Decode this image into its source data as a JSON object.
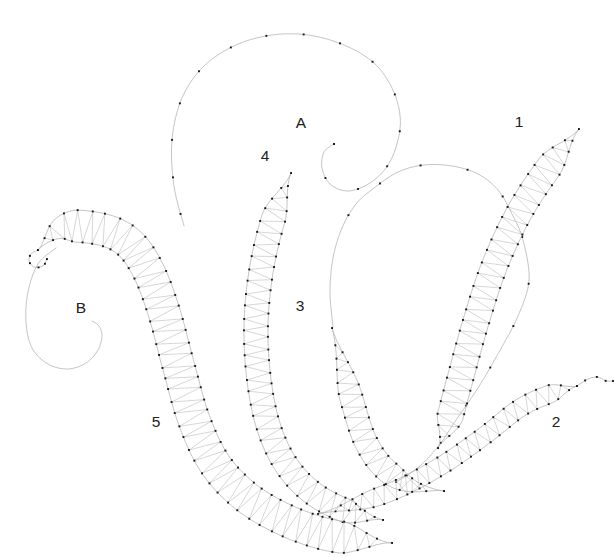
{
  "figure": {
    "type": "lace-pricking-pattern-drawing",
    "width": 615,
    "height": 557,
    "background": "#ffffff"
  },
  "style": {
    "line_color": "#b4b4b4",
    "zigzag_color": "#c6c6c6",
    "dot_color": "#161616",
    "label_color": "#212121",
    "line_width": 0.8,
    "zigzag_width": 0.7,
    "dot_size": 1.9,
    "pin_spacing": 12,
    "curve_dot_spacing": 40
  },
  "labels": [
    {
      "text": "A",
      "x": 301,
      "y": 128
    },
    {
      "text": "1",
      "x": 519,
      "y": 127
    },
    {
      "text": "4",
      "x": 265,
      "y": 161
    },
    {
      "text": "3",
      "x": 300,
      "y": 311
    },
    {
      "text": "B",
      "x": 81,
      "y": 313
    },
    {
      "text": "5",
      "x": 156,
      "y": 427
    },
    {
      "text": "2",
      "x": 556,
      "y": 427
    }
  ],
  "leaves": [
    {
      "id": "leaf-1",
      "pattern_number": "1",
      "max_width": 26,
      "tip_ramp": 0.14,
      "base_ramp": 0.1,
      "centerline": [
        [
          579,
          129
        ],
        [
          549,
          167
        ],
        [
          519,
          213
        ],
        [
          494,
          267
        ],
        [
          475,
          325
        ],
        [
          459,
          383
        ],
        [
          447,
          427
        ],
        [
          438,
          448
        ]
      ]
    },
    {
      "id": "leaf-2",
      "pattern_number": "2",
      "max_width": 18,
      "tip_ramp": 0.22,
      "base_ramp": 0.1,
      "centerline": [
        [
          318,
          514
        ],
        [
          356,
          504
        ],
        [
          400,
          488
        ],
        [
          444,
          464
        ],
        [
          484,
          436
        ],
        [
          520,
          408
        ],
        [
          550,
          394
        ],
        [
          577,
          386
        ]
      ]
    },
    {
      "id": "leaf-3",
      "pattern_number": "3",
      "max_width": 23,
      "tip_ramp": 0.34,
      "base_ramp": 0.28,
      "centerline": [
        [
          332,
          328
        ],
        [
          343,
          366
        ],
        [
          353,
          404
        ],
        [
          365,
          440
        ],
        [
          383,
          467
        ],
        [
          410,
          485
        ],
        [
          444,
          491
        ]
      ]
    },
    {
      "id": "leaf-4",
      "pattern_number": "4",
      "max_width": 24,
      "tip_ramp": 0.12,
      "base_ramp": 0.1,
      "centerline": [
        [
          291,
          173
        ],
        [
          273,
          220
        ],
        [
          261,
          272
        ],
        [
          256,
          326
        ],
        [
          259,
          380
        ],
        [
          269,
          428
        ],
        [
          287,
          466
        ],
        [
          314,
          494
        ],
        [
          349,
          512
        ],
        [
          383,
          520
        ]
      ]
    },
    {
      "id": "leaf-5",
      "pattern_number": "5",
      "max_width": 32,
      "tip_ramp": 0.09,
      "base_ramp": 0.1,
      "centerline": [
        [
          38,
          250
        ],
        [
          62,
          228
        ],
        [
          100,
          229
        ],
        [
          128,
          242
        ],
        [
          148,
          270
        ],
        [
          164,
          312
        ],
        [
          178,
          364
        ],
        [
          194,
          420
        ],
        [
          215,
          464
        ],
        [
          245,
          496
        ],
        [
          281,
          518
        ],
        [
          321,
          533
        ],
        [
          361,
          540
        ],
        [
          392,
          543
        ]
      ]
    }
  ],
  "curves": [
    {
      "id": "scroll-curve-a",
      "dots": true,
      "dot_spacing": 38,
      "dot_skip_start": 0.02,
      "points": [
        [
          184,
          226
        ],
        [
          174,
          186
        ],
        [
          172,
          140
        ],
        [
          182,
          98
        ],
        [
          204,
          66
        ],
        [
          236,
          45
        ],
        [
          272,
          35
        ],
        [
          308,
          35
        ],
        [
          344,
          45
        ],
        [
          374,
          63
        ],
        [
          392,
          88
        ],
        [
          400,
          115
        ],
        [
          398,
          140
        ],
        [
          388,
          165
        ],
        [
          370,
          183
        ],
        [
          348,
          191
        ],
        [
          330,
          184
        ],
        [
          322,
          168
        ],
        [
          324,
          152
        ],
        [
          334,
          144
        ]
      ]
    },
    {
      "id": "swirl-loop-curve",
      "dots": true,
      "dot_spacing": 46,
      "dot_skip_start": 0.18,
      "points": [
        [
          333,
          327
        ],
        [
          330,
          292
        ],
        [
          333,
          258
        ],
        [
          342,
          228
        ],
        [
          356,
          204
        ],
        [
          374,
          188
        ],
        [
          398,
          172
        ],
        [
          424,
          165
        ],
        [
          452,
          166
        ],
        [
          478,
          174
        ],
        [
          498,
          190
        ],
        [
          512,
          214
        ],
        [
          523,
          240
        ],
        [
          529,
          280
        ],
        [
          518,
          316
        ],
        [
          499,
          352
        ],
        [
          478,
          388
        ],
        [
          456,
          420
        ],
        [
          440,
          444
        ],
        [
          420,
          466
        ],
        [
          396,
          482
        ]
      ]
    },
    {
      "id": "scroll-curve-b",
      "dots": false,
      "points": [
        [
          56,
          248
        ],
        [
          38,
          264
        ],
        [
          28,
          292
        ],
        [
          26,
          322
        ],
        [
          32,
          348
        ],
        [
          48,
          364
        ],
        [
          68,
          369
        ],
        [
          86,
          363
        ],
        [
          98,
          350
        ],
        [
          102,
          336
        ],
        [
          99,
          326
        ],
        [
          92,
          321
        ]
      ]
    },
    {
      "id": "leaf-5-tip-curl",
      "dots": true,
      "dot_spacing": 9,
      "points": [
        [
          38,
          250
        ],
        [
          31,
          254
        ],
        [
          29,
          261
        ],
        [
          34,
          267
        ],
        [
          43,
          266
        ],
        [
          47,
          259
        ]
      ]
    },
    {
      "id": "leaf-2-tail-extension",
      "dots": true,
      "dot_spacing": 11,
      "points": [
        [
          577,
          386
        ],
        [
          588,
          379
        ],
        [
          598,
          377
        ],
        [
          606,
          381
        ],
        [
          613,
          381
        ]
      ]
    }
  ]
}
